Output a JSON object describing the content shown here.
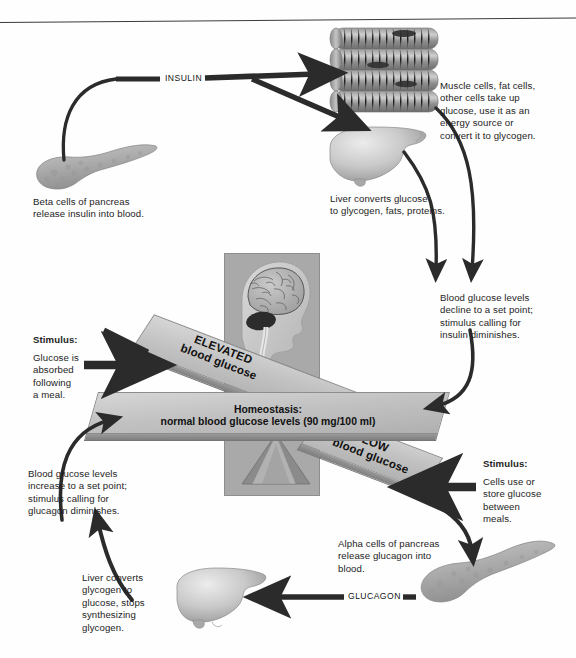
{
  "figure": {
    "center_panel": {
      "illustration": "human-head-brain-profile",
      "beam_center_line1": "Homeostasis:",
      "beam_center_line2": "normal blood glucose levels (90 mg/100 ml)",
      "beam_elevated_line1": "ELEVATED",
      "beam_elevated_line2": "blood glucose",
      "beam_low_line1": "LOW",
      "beam_low_line2": "blood glucose"
    },
    "hormone_labels": {
      "insulin": "INSULIN",
      "glucagon": "GLUCAGON"
    },
    "captions": {
      "beta_cells": "Beta cells of pancreas\nrelease insulin into blood.",
      "muscle_cells": "Muscle cells, fat cells,\nother cells take up\nglucose, use it as an\nenergy source or\nconvert it to glycogen.",
      "liver_top": "Liver converts glucose\nto glycogen, fats, proteins.",
      "decline": "Blood glucose levels\ndecline to a set point;\nstimulus calling for\ninsulin diminishes.",
      "stimulus_meal_head": "Stimulus:",
      "stimulus_meal_body": "Glucose is\nabsorbed\nfollowing\na meal.",
      "stimulus_between_head": "Stimulus:",
      "stimulus_between_body": "Cells use or\nstore glucose\nbetween\nmeals.",
      "increase": "Blood glucose levels\nincrease to a set point;\nstimulus calling for\nglucagon diminishes.",
      "liver_bottom": "Liver converts\nglycogen to\nglucose, stops\nsynthesizing\nglycogen.",
      "alpha_cells": "Alpha cells of pancreas\nrelease glucagon into\nblood."
    },
    "organs": {
      "pancreas_top": "pancreas-illustration",
      "pancreas_bottom": "pancreas-illustration",
      "liver_top": "liver-illustration",
      "liver_bottom": "liver-illustration",
      "muscle": "muscle-fibers-illustration",
      "head": "head-brain-illustration"
    },
    "colors": {
      "ink": "#1a1a1a",
      "arrow": "#2e2e2e",
      "beam_face": "#c6c6c6",
      "panel": "#a9a9a9",
      "background": "#ffffff"
    }
  }
}
